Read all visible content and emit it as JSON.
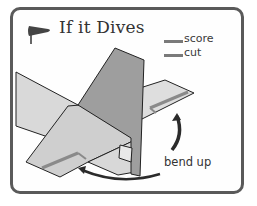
{
  "title": "If it Dives",
  "legend": [
    {
      "label": "score",
      "line_color": "#7a7a7a"
    },
    {
      "label": "cut",
      "line_color": "#7a7a7a"
    }
  ],
  "annotation": {
    "bend_label": "bend up"
  },
  "icons": {
    "title_icon": "windsock-icon"
  },
  "colors": {
    "frame": "#5a5a5a",
    "fin": "#9a9a9a",
    "wing_light": "#d6d6d6",
    "wing_mid": "#c8c8c8",
    "arrow": "#333333"
  }
}
